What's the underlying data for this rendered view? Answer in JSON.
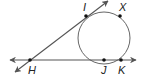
{
  "diagram": {
    "type": "geometry",
    "colors": {
      "line": "#555555",
      "circle": "#666666",
      "point": "#111111",
      "label": "#222222"
    },
    "circle": {
      "cx": 104,
      "cy": 38,
      "r": 26
    },
    "points": [
      {
        "name": "I",
        "x": 86,
        "y": 16,
        "label_x": 83,
        "label_y": 11
      },
      {
        "name": "X",
        "x": 120,
        "y": 16,
        "label_x": 119,
        "label_y": 11
      },
      {
        "name": "H",
        "x": 30,
        "y": 60,
        "label_x": 28,
        "label_y": 74
      },
      {
        "name": "J",
        "x": 104,
        "y": 60,
        "label_x": 101,
        "label_y": 74
      },
      {
        "name": "K",
        "x": 121,
        "y": 60,
        "label_x": 118,
        "label_y": 74
      }
    ],
    "lines": [
      {
        "name": "line-HK",
        "x1": 10,
        "y1": 60,
        "x2": 136,
        "y2": 60,
        "arrows": "both"
      },
      {
        "name": "line-HI",
        "x1": 15,
        "y1": 72,
        "x2": 108,
        "y2": 1,
        "arrows": "both"
      }
    ]
  }
}
